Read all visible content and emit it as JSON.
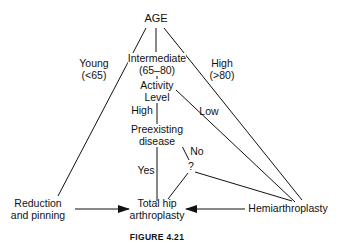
{
  "diagram": {
    "root": "AGE",
    "branches": {
      "young": {
        "label": "Young",
        "range": "(<65)"
      },
      "intermediate": {
        "label": "Intermediate",
        "range": "(65–80)"
      },
      "high_age": {
        "label": "High",
        "range": "(>80)"
      }
    },
    "nodes": {
      "activity": {
        "line1": "Activity",
        "line2": "Level"
      },
      "preexisting": {
        "line1": "Preexisting",
        "line2": "disease"
      },
      "question": "?",
      "reduction": {
        "line1": "Reduction",
        "line2": "and pinning"
      },
      "total_hip": {
        "line1": "Total hip",
        "line2": "arthroplasty"
      },
      "hemi": "Hemiarthroplasty"
    },
    "edge_labels": {
      "activity_high": "High",
      "activity_low": "Low",
      "disease_yes": "Yes",
      "disease_no": "No"
    },
    "caption": "FIGURE 4.21"
  }
}
